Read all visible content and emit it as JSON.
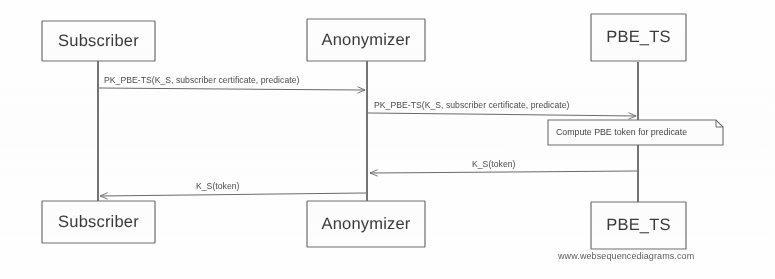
{
  "diagram": {
    "type": "uml-sequence-diagram",
    "watermark": "www.websequencediagrams.com",
    "line_color": "#6b6b6b",
    "text_color": "#3f3f3f",
    "background": "#fefefe"
  },
  "actors": [
    {
      "name": "Subscriber",
      "lifeline_x": 98,
      "top_label": "Subscriber",
      "bottom_label": "Subscriber"
    },
    {
      "name": "Anonymizer",
      "lifeline_x": 367,
      "top_label": "Anonymizer",
      "bottom_label": "Anonymizer"
    },
    {
      "name": "PBE_TS",
      "lifeline_x": 638,
      "top_label": "PBE_TS",
      "bottom_label": "PBE_TS"
    }
  ],
  "messages": [
    {
      "index": 1,
      "label": "PK_PBE-TS(K_S, subscriber certificate, predicate)",
      "from": "Subscriber",
      "to": "Anonymizer",
      "direction": "right",
      "y": 88
    },
    {
      "index": 2,
      "label": "PK_PBE-TS(K_S, subscriber certificate, predicate)",
      "from": "Anonymizer",
      "to": "PBE_TS",
      "direction": "right",
      "y": 113
    },
    {
      "index": 3,
      "label": "K_S(token)",
      "from": "PBE_TS",
      "to": "Anonymizer",
      "direction": "left",
      "y": 172
    },
    {
      "index": 4,
      "label": "K_S(token)",
      "from": "Anonymizer",
      "to": "Subscriber",
      "direction": "left",
      "y": 194
    }
  ],
  "notes": [
    {
      "label": "Compute PBE token for predicate",
      "attached_to": "PBE_TS",
      "x": 548,
      "y": 120,
      "width": 175,
      "height": 25
    }
  ]
}
